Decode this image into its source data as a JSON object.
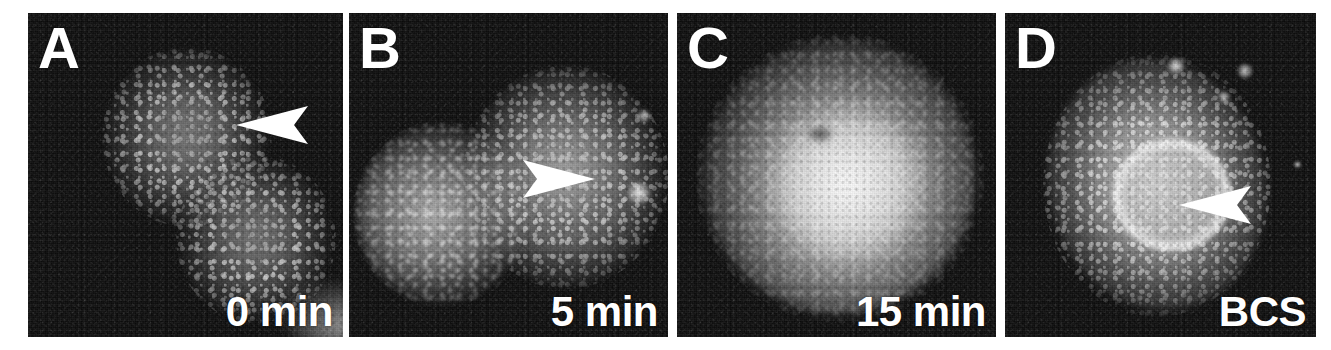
{
  "figure": {
    "type": "fluorescence-micrograph-panel-series",
    "background_color": "#ffffff",
    "panel_background_color": "#0d0d0d",
    "overlay_text_color": "#ffffff",
    "panel_count": 4
  },
  "panels": [
    {
      "letter": "A",
      "caption": "0 min",
      "arrowhead": {
        "present": true,
        "direction": "left",
        "x": 282,
        "y": 113
      },
      "description": "Two cells with bright punctate vesicular staining on a dark background",
      "bounds": {
        "x": 28,
        "y": 13,
        "width": 315,
        "height": 324
      }
    },
    {
      "letter": "B",
      "caption": "5 min",
      "arrowhead": {
        "present": true,
        "direction": "right",
        "x": 530,
        "y": 175
      },
      "description": "Two adjacent cells with brighter, partly dispersed staining",
      "bounds": {
        "x": 349,
        "y": 13,
        "width": 319,
        "height": 324
      }
    },
    {
      "letter": "C",
      "caption": "15 min",
      "arrowhead": {
        "present": false,
        "direction": "",
        "x": 0,
        "y": 0
      },
      "description": "Single cell with uniformly bright diffuse cytoplasmic signal",
      "bounds": {
        "x": 677,
        "y": 13,
        "width": 319,
        "height": 324
      }
    },
    {
      "letter": "D",
      "caption": "BCS",
      "arrowhead": {
        "present": true,
        "direction": "left",
        "x": 1248,
        "y": 205
      },
      "description": "Single cell with bright perinuclear ring and punctate periphery",
      "bounds": {
        "x": 1005,
        "y": 13,
        "width": 311,
        "height": 324
      }
    }
  ]
}
